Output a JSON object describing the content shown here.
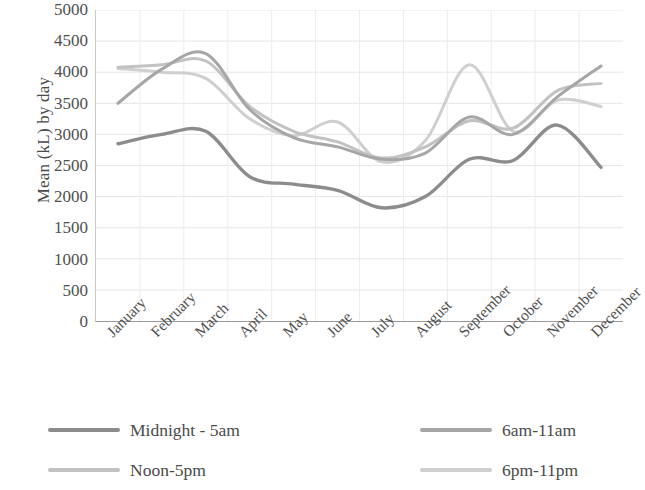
{
  "chart_data": {
    "type": "line",
    "title": "",
    "xlabel": "",
    "ylabel": "Mean (kL) by day",
    "ylim": [
      0,
      5000
    ],
    "y_ticks": [
      0,
      500,
      1000,
      1500,
      2000,
      2500,
      3000,
      3500,
      4000,
      4500,
      5000
    ],
    "grid": true,
    "legend_position": "bottom",
    "categories": [
      "January",
      "February",
      "March",
      "April",
      "May",
      "June",
      "July",
      "August",
      "September",
      "October",
      "November",
      "December"
    ],
    "series": [
      {
        "name": "Midnight - 5am",
        "color": "#8c8c8c",
        "values": [
          2850,
          3000,
          3050,
          2320,
          2200,
          2100,
          1820,
          2000,
          2600,
          2580,
          3150,
          2470
        ]
      },
      {
        "name": "6am-11am",
        "color": "#a6a6a6",
        "values": [
          3500,
          4050,
          4300,
          3400,
          2950,
          2800,
          2600,
          2700,
          3280,
          3000,
          3600,
          4100
        ]
      },
      {
        "name": "Noon-5pm",
        "color": "#c2c2c2",
        "values": [
          4080,
          4120,
          4180,
          3450,
          3050,
          2880,
          2620,
          2800,
          3220,
          3100,
          3700,
          3820
        ]
      },
      {
        "name": "6pm-11pm",
        "color": "#cfcfcf",
        "values": [
          4060,
          4000,
          3900,
          3250,
          2980,
          3200,
          2560,
          2900,
          4120,
          3050,
          3550,
          3450
        ]
      }
    ]
  },
  "axis": {
    "y_title": "Mean (kL) by day",
    "y_tick_labels": [
      "5000",
      "4500",
      "4000",
      "3500",
      "3000",
      "2500",
      "2000",
      "1500",
      "1000",
      "500",
      "0"
    ],
    "x_tick_labels": [
      "January",
      "February",
      "March",
      "April",
      "May",
      "June",
      "July",
      "August",
      "September",
      "October",
      "November",
      "December"
    ]
  },
  "legend": {
    "items": [
      {
        "label": "Midnight - 5am",
        "color": "#8c8c8c"
      },
      {
        "label": "6am-11am",
        "color": "#a6a6a6"
      },
      {
        "label": "Noon-5pm",
        "color": "#c2c2c2"
      },
      {
        "label": "6pm-11pm",
        "color": "#cfcfcf"
      }
    ]
  }
}
